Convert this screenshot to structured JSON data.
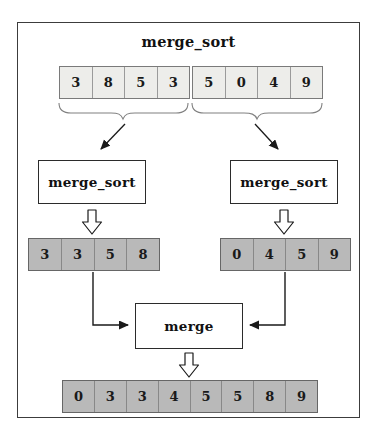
{
  "title": "merge_sort",
  "nodes": {
    "merge_sort_left": {
      "label": "merge_sort"
    },
    "merge_sort_right": {
      "label": "merge_sort"
    },
    "merge": {
      "label": "merge"
    }
  },
  "arrays": {
    "input": {
      "values": [
        "3",
        "8",
        "5",
        "3",
        "5",
        "0",
        "4",
        "9"
      ]
    },
    "left_sorted": {
      "values": [
        "3",
        "3",
        "5",
        "8"
      ]
    },
    "right_sorted": {
      "values": [
        "0",
        "4",
        "5",
        "9"
      ]
    },
    "result": {
      "values": [
        "0",
        "3",
        "3",
        "4",
        "5",
        "5",
        "8",
        "9"
      ]
    }
  },
  "colors": {
    "input_cell_fill": "#ededea",
    "sorted_cell_fill": "#b9b9b9",
    "node_fill": "#ffffff",
    "frame_border": "#3c3c3c",
    "arrow_line": "#1a1a1a",
    "brace_line": "#808080"
  }
}
